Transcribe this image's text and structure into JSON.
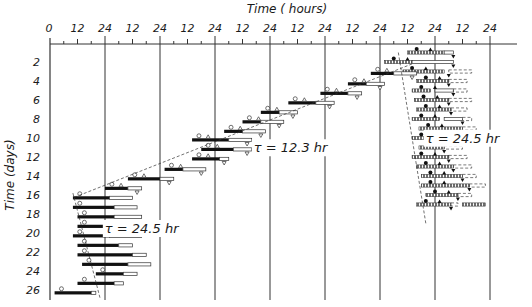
{
  "chart_data": {
    "type": "actogram",
    "title": "",
    "xlabel": "Time ( hours)",
    "ylabel": "Time (days)",
    "x_tick_labels": [
      "0",
      "12",
      "24",
      "12",
      "24",
      "12",
      "24",
      "12",
      "24",
      "12",
      "24",
      "12",
      "24",
      "12",
      "24",
      "12",
      "24"
    ],
    "x_range_hours": [
      0,
      192
    ],
    "y_tick_labels": [
      "2",
      "4",
      "6",
      "8",
      "10",
      "12",
      "14",
      "16",
      "18",
      "20",
      "22",
      "24",
      "26"
    ],
    "y_range_days": [
      0,
      27
    ],
    "grid": "vertical lines every 24 h",
    "annotations": [
      {
        "text": "τ = 12.3 hr",
        "at_hours": 105,
        "at_day": 11.5
      },
      {
        "text": "τ = 24.5 hr",
        "at_hours": 180,
        "at_day": 10.5
      },
      {
        "text": "τ = 24.5 hr",
        "at_hours": 40,
        "at_day": 20
      }
    ],
    "legend": "none",
    "series": [
      {
        "name": "free-run τ=24.5 hr (days 1–18, right)",
        "style": "hatched",
        "rows": [
          {
            "day": 1,
            "solid": [
              156,
              172
            ],
            "open": [
              172,
              176
            ],
            "dashed": []
          },
          {
            "day": 2,
            "solid": [
              146,
              158
            ],
            "open": [
              158,
              176
            ],
            "dashed": []
          },
          {
            "day": 3,
            "solid": [
              154,
              172
            ],
            "open": [],
            "dashed": [
              174,
              184
            ]
          },
          {
            "day": 4,
            "solid": [
              160,
              174
            ],
            "open": [],
            "dashed": [
              174,
              182
            ]
          },
          {
            "day": 5,
            "solid": [
              158,
              166
            ],
            "open": [
              168,
              176
            ],
            "dashed": [
              176,
              182
            ]
          },
          {
            "day": 6,
            "solid": [
              159,
              174
            ],
            "open": [],
            "dashed": [
              174,
              184
            ]
          },
          {
            "day": 7,
            "solid": [
              160,
              175
            ],
            "open": [],
            "dashed": [
              175,
              182
            ]
          },
          {
            "day": 8,
            "solid": [
              158,
              170
            ],
            "open": [
              172,
              180
            ],
            "dashed": [
              180,
              184
            ]
          },
          {
            "day": 9,
            "solid": [
              161,
              180
            ],
            "open": [],
            "dashed": [
              180,
              186
            ]
          },
          {
            "day": 10,
            "solid": [
              158,
              172
            ],
            "open": [],
            "dashed": [
              172,
              182
            ]
          },
          {
            "day": 11,
            "solid": [
              161,
              172
            ],
            "open": [],
            "dashed": [
              172,
              180
            ]
          },
          {
            "day": 12,
            "solid": [
              158,
              174
            ],
            "open": [],
            "dashed": [
              174,
              182
            ]
          },
          {
            "day": 13,
            "solid": [
              160,
              176
            ],
            "open": [],
            "dashed": [
              176,
              184
            ]
          },
          {
            "day": 14,
            "solid": [
              162,
              180
            ],
            "open": [],
            "dashed": [
              180,
              186
            ]
          },
          {
            "day": 15,
            "solid": [
              162,
              183
            ],
            "open": [],
            "dashed": [
              183,
              190
            ]
          },
          {
            "day": 16,
            "solid": [
              164,
              178
            ],
            "open": [],
            "dashed": [
              178,
              184
            ]
          },
          {
            "day": 17,
            "solid": [
              160,
              175
            ],
            "open": [],
            "dashed": [
              175,
              178
            ],
            "extra": [
              180,
              190
            ]
          }
        ]
      },
      {
        "name": "ultradian transition τ=12.3 hr (staircase)",
        "style": "solid+open",
        "rows": [
          {
            "day": 3.2,
            "solid": [
              140,
              150
            ],
            "open": [
              150,
              160
            ]
          },
          {
            "day": 4.3,
            "solid": [
              130,
              138
            ],
            "open": [
              138,
              146
            ]
          },
          {
            "day": 5.3,
            "solid": [
              118,
              130
            ],
            "open": [
              130,
              136
            ]
          },
          {
            "day": 6.3,
            "solid": [
              104,
              116
            ],
            "open": [
              116,
              124
            ]
          },
          {
            "day": 7.3,
            "solid": [
              92,
              100
            ],
            "open": [
              100,
              108
            ]
          },
          {
            "day": 8.3,
            "solid": [
              84,
              92
            ],
            "open": [
              92,
              102
            ]
          },
          {
            "day": 9.3,
            "solid": [
              76,
              84
            ],
            "open": [
              84,
              94
            ]
          },
          {
            "day": 10.2,
            "solid": [
              62,
              78
            ],
            "open": [
              78,
              88
            ]
          },
          {
            "day": 11.2,
            "solid": [
              66,
              80
            ],
            "open": [
              80,
              88
            ]
          },
          {
            "day": 12.2,
            "solid": [
              62,
              74
            ],
            "open": [
              74,
              78
            ]
          },
          {
            "day": 13.3,
            "solid": [
              50,
              58
            ],
            "open": [
              58,
              68
            ]
          },
          {
            "day": 14.3,
            "solid": [
              34,
              48
            ],
            "open": [
              48,
              54
            ]
          },
          {
            "day": 15.3,
            "solid": [
              24,
              34
            ],
            "open": [
              34,
              40
            ]
          }
        ]
      },
      {
        "name": "free-run τ=24.5 hr (days 16–26, left)",
        "style": "solid+open",
        "rows": [
          {
            "day": 16.3,
            "solid": [
              10,
              26
            ],
            "open": [
              26,
              36
            ]
          },
          {
            "day": 17.3,
            "solid": [
              10,
              28
            ],
            "open": [
              28,
              38
            ]
          },
          {
            "day": 18.3,
            "solid": [
              12,
              28
            ],
            "open": [
              28,
              40
            ]
          },
          {
            "day": 19.3,
            "solid": [
              12,
              28
            ],
            "open": [
              28,
              38
            ]
          },
          {
            "day": 20.3,
            "solid": [
              10,
              26
            ],
            "open": [
              26,
              40
            ]
          },
          {
            "day": 21.3,
            "solid": [
              12,
              30
            ],
            "open": [
              30,
              36
            ]
          },
          {
            "day": 22.3,
            "solid": [
              12,
              36
            ],
            "open": [
              36,
              42
            ]
          },
          {
            "day": 23.3,
            "solid": [
              14,
              34
            ],
            "open": [
              34,
              44
            ]
          },
          {
            "day": 24.3,
            "solid": [
              20,
              32
            ],
            "open": [
              32,
              38
            ]
          },
          {
            "day": 25.3,
            "solid": [
              12,
              28
            ],
            "open": [
              28,
              32
            ]
          },
          {
            "day": 26.3,
            "solid": [
              2,
              18
            ],
            "open": [
              18,
              20
            ]
          }
        ]
      }
    ]
  }
}
